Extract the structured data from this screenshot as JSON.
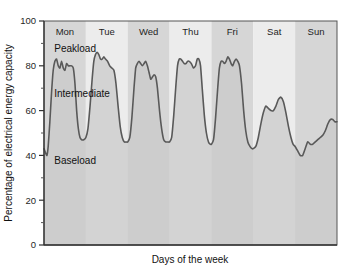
{
  "chart_data": {
    "type": "area",
    "title": "",
    "xlabel": "Days of the week",
    "ylabel": "Percentage of electrical energy capacity",
    "ylim": [
      0,
      100
    ],
    "yticks": [
      0,
      20,
      40,
      60,
      80,
      100
    ],
    "ytick_labels": [
      "0",
      "20",
      "40",
      "60",
      "80",
      "100"
    ],
    "yminor_step": 10,
    "grid": false,
    "legend": "none",
    "categories": [
      "Mon",
      "Tue",
      "Wed",
      "Thu",
      "Fri",
      "Sat",
      "Sun"
    ],
    "band_colors": [
      "#d6d6d6",
      "#ececec"
    ],
    "line_color": "#595959",
    "fill_color": "#c9c9c9",
    "annotations": [
      {
        "text": "Peakload",
        "x_pct": 3.5,
        "y_value": 86
      },
      {
        "text": "Intermediate",
        "x_pct": 3.5,
        "y_value": 66
      },
      {
        "text": "Baseload",
        "x_pct": 3.5,
        "y_value": 36
      }
    ],
    "x_unit": "day_fraction",
    "series": [
      {
        "name": "Electrical load",
        "points": [
          [
            0.0,
            43
          ],
          [
            0.04,
            41
          ],
          [
            0.07,
            40
          ],
          [
            0.1,
            44
          ],
          [
            0.14,
            55
          ],
          [
            0.18,
            68
          ],
          [
            0.22,
            78
          ],
          [
            0.26,
            82
          ],
          [
            0.3,
            83
          ],
          [
            0.34,
            80
          ],
          [
            0.38,
            79
          ],
          [
            0.42,
            82
          ],
          [
            0.46,
            79
          ],
          [
            0.5,
            78
          ],
          [
            0.54,
            81
          ],
          [
            0.58,
            80
          ],
          [
            0.62,
            80
          ],
          [
            0.66,
            80
          ],
          [
            0.7,
            79
          ],
          [
            0.74,
            72
          ],
          [
            0.78,
            60
          ],
          [
            0.82,
            52
          ],
          [
            0.86,
            48
          ],
          [
            0.9,
            47
          ],
          [
            0.95,
            47
          ],
          [
            1.0,
            48
          ],
          [
            1.05,
            52
          ],
          [
            1.1,
            62
          ],
          [
            1.15,
            74
          ],
          [
            1.19,
            82
          ],
          [
            1.23,
            85
          ],
          [
            1.27,
            86
          ],
          [
            1.31,
            85
          ],
          [
            1.35,
            83
          ],
          [
            1.39,
            83
          ],
          [
            1.43,
            84
          ],
          [
            1.47,
            83
          ],
          [
            1.52,
            82
          ],
          [
            1.57,
            80
          ],
          [
            1.62,
            79
          ],
          [
            1.67,
            78
          ],
          [
            1.72,
            72
          ],
          [
            1.77,
            62
          ],
          [
            1.82,
            53
          ],
          [
            1.87,
            48
          ],
          [
            1.92,
            46
          ],
          [
            1.96,
            46
          ],
          [
            2.0,
            46
          ],
          [
            2.05,
            48
          ],
          [
            2.1,
            57
          ],
          [
            2.15,
            70
          ],
          [
            2.19,
            79
          ],
          [
            2.23,
            81
          ],
          [
            2.27,
            82
          ],
          [
            2.31,
            81
          ],
          [
            2.35,
            80
          ],
          [
            2.39,
            81
          ],
          [
            2.43,
            82
          ],
          [
            2.47,
            80
          ],
          [
            2.51,
            77
          ],
          [
            2.55,
            74
          ],
          [
            2.59,
            75
          ],
          [
            2.63,
            76
          ],
          [
            2.67,
            75
          ],
          [
            2.71,
            70
          ],
          [
            2.76,
            60
          ],
          [
            2.81,
            52
          ],
          [
            2.86,
            47
          ],
          [
            2.91,
            46
          ],
          [
            2.96,
            46
          ],
          [
            3.0,
            46
          ],
          [
            3.05,
            48
          ],
          [
            3.1,
            58
          ],
          [
            3.15,
            71
          ],
          [
            3.19,
            80
          ],
          [
            3.23,
            83
          ],
          [
            3.27,
            83
          ],
          [
            3.31,
            82
          ],
          [
            3.35,
            81
          ],
          [
            3.39,
            81
          ],
          [
            3.43,
            82
          ],
          [
            3.47,
            82
          ],
          [
            3.52,
            81
          ],
          [
            3.57,
            79
          ],
          [
            3.62,
            80
          ],
          [
            3.66,
            83
          ],
          [
            3.7,
            83
          ],
          [
            3.74,
            80
          ],
          [
            3.78,
            70
          ],
          [
            3.83,
            58
          ],
          [
            3.88,
            50
          ],
          [
            3.93,
            46
          ],
          [
            3.97,
            45
          ],
          [
            4.0,
            45
          ],
          [
            4.05,
            47
          ],
          [
            4.1,
            57
          ],
          [
            4.15,
            70
          ],
          [
            4.19,
            79
          ],
          [
            4.23,
            82
          ],
          [
            4.27,
            82
          ],
          [
            4.31,
            81
          ],
          [
            4.35,
            82
          ],
          [
            4.39,
            84
          ],
          [
            4.43,
            83
          ],
          [
            4.47,
            81
          ],
          [
            4.51,
            80
          ],
          [
            4.55,
            82
          ],
          [
            4.59,
            83
          ],
          [
            4.63,
            82
          ],
          [
            4.67,
            80
          ],
          [
            4.72,
            72
          ],
          [
            4.77,
            60
          ],
          [
            4.82,
            51
          ],
          [
            4.87,
            46
          ],
          [
            4.92,
            44
          ],
          [
            4.97,
            43
          ],
          [
            5.0,
            43
          ],
          [
            5.06,
            44
          ],
          [
            5.12,
            48
          ],
          [
            5.18,
            54
          ],
          [
            5.24,
            59
          ],
          [
            5.3,
            62
          ],
          [
            5.36,
            61
          ],
          [
            5.42,
            60
          ],
          [
            5.48,
            60
          ],
          [
            5.54,
            62
          ],
          [
            5.6,
            65
          ],
          [
            5.66,
            66
          ],
          [
            5.72,
            64
          ],
          [
            5.78,
            59
          ],
          [
            5.84,
            53
          ],
          [
            5.9,
            48
          ],
          [
            5.95,
            45
          ],
          [
            6.0,
            44
          ],
          [
            6.06,
            42
          ],
          [
            6.12,
            40
          ],
          [
            6.18,
            40
          ],
          [
            6.24,
            43
          ],
          [
            6.3,
            46
          ],
          [
            6.36,
            45
          ],
          [
            6.42,
            45
          ],
          [
            6.48,
            46
          ],
          [
            6.54,
            47
          ],
          [
            6.6,
            48
          ],
          [
            6.66,
            49
          ],
          [
            6.72,
            51
          ],
          [
            6.78,
            54
          ],
          [
            6.84,
            56
          ],
          [
            6.9,
            56
          ],
          [
            6.95,
            55
          ],
          [
            7.0,
            55
          ]
        ]
      }
    ]
  },
  "axes": {
    "y_title": "Percentage of electrical energy capacity",
    "x_title": "Days of the week"
  }
}
